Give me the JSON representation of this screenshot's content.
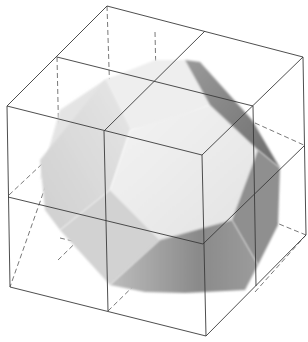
{
  "figure": {
    "title": "Truncated octahedron inscribed in a 2x2x2 cube lattice",
    "lattice": "2x2x2 cube wireframe, hidden edges dashed",
    "colors": {
      "background": "#ffffff",
      "edge": "#3a3a3a",
      "face_light": "#ececec",
      "face_mid": "#d4d4d4",
      "face_dark": "#8e8e8e",
      "face_darkest": "#6a6a6a"
    }
  }
}
